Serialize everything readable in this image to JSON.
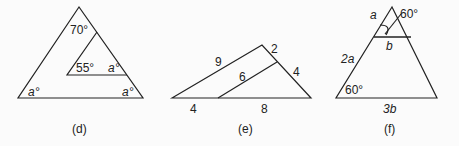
{
  "figures": [
    {
      "id": "d",
      "caption": "(d)",
      "labels": {
        "apex": "70°",
        "inner_left": "55°",
        "inner_right": "a°",
        "outer_left": "a°",
        "outer_right": "a°"
      }
    },
    {
      "id": "e",
      "caption": "(e)",
      "labels": {
        "left_side": "9",
        "right_top": "2",
        "right_bottom": "4",
        "inner": "6",
        "base_left": "4",
        "base_right": "8"
      }
    },
    {
      "id": "f",
      "caption": "(f)",
      "labels": {
        "top_left_side": "a",
        "angle_top": "60°",
        "inner_base": "b",
        "left_side": "2a",
        "base_angle": "60°",
        "base": "3b"
      }
    }
  ]
}
